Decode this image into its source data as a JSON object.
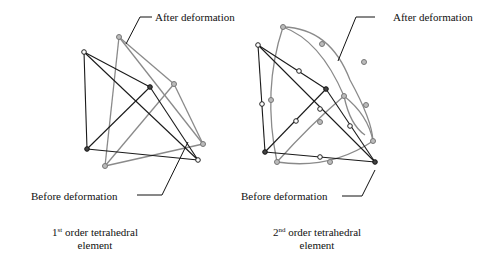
{
  "figure": {
    "left": {
      "after_label": "After deformation",
      "before_label": "Before deformation",
      "caption": {
        "order_num": "1",
        "order_sup": "st",
        "line1_rest": " order tetrahedral",
        "line2": "element"
      }
    },
    "right": {
      "after_label": "After deformation",
      "before_label": "Before deformation",
      "caption": {
        "order_num": "2",
        "order_sup": "nd",
        "line1_rest": " order tetrahedral",
        "line2": "element"
      }
    }
  },
  "colors": {
    "before": "#1a1a1a",
    "after": "#8a8a8a",
    "text": "#111111"
  }
}
